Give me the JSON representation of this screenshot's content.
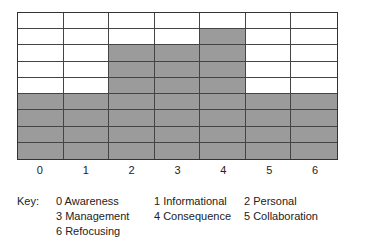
{
  "chart_data": {
    "type": "bar",
    "style": "stacked-grid-blocks",
    "categories": [
      "0",
      "1",
      "2",
      "3",
      "4",
      "5",
      "6"
    ],
    "values": [
      4,
      4,
      7,
      7,
      8,
      4,
      4
    ],
    "ylim": [
      0,
      9
    ],
    "grid": true,
    "title": "",
    "xlabel": "",
    "ylabel": "",
    "fill_color": "#9b9b9b",
    "legend": {
      "title": "Key:",
      "entries": [
        {
          "code": "0",
          "label": "Awareness"
        },
        {
          "code": "1",
          "label": "Informational"
        },
        {
          "code": "2",
          "label": "Personal"
        },
        {
          "code": "3",
          "label": "Management"
        },
        {
          "code": "4",
          "label": "Consequence"
        },
        {
          "code": "5",
          "label": "Collaboration"
        },
        {
          "code": "6",
          "label": "Refocusing"
        }
      ]
    }
  },
  "key": {
    "title": "Key:",
    "items": [
      "0  Awareness",
      "1  Informational",
      "2  Personal",
      "3  Management",
      "4  Consequence",
      "5  Collaboration",
      "6  Refocusing"
    ]
  }
}
